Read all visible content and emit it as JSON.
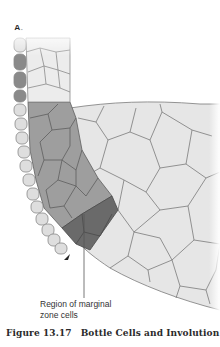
{
  "figure": {
    "panel_label": "A.",
    "callout_label_line1": "Region of marginal",
    "callout_label_line2": "zone cells",
    "caption_number": "Figure 13.17",
    "caption_title": "Bottle Cells and Involution",
    "colors": {
      "light_cells": "#e6e6e6",
      "medium_cells": "#9e9e9e",
      "dark_cells": "#6a6a6a",
      "outer_bead_cells": "#dedede",
      "bottle_cells": "#8a8a8a",
      "cell_outline": "#7a7a7a"
    },
    "icons": [
      "arrowhead-icon"
    ]
  }
}
